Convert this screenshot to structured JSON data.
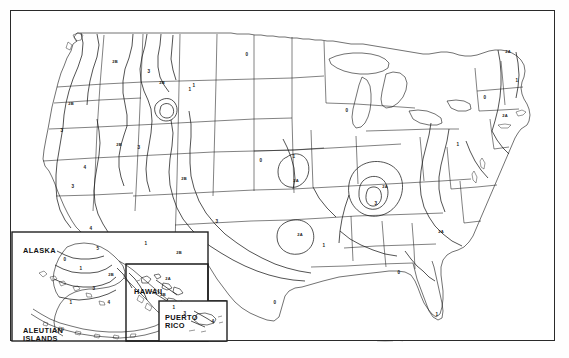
{
  "figure": {
    "background_color": "#ffffff",
    "line_color": "#1a1a1a",
    "frame_color": "#2a2a2a"
  },
  "insets": [
    {
      "id": "alaska",
      "label": "ALASKA"
    },
    {
      "id": "aleutian",
      "label": "ALEUTIAN\nISLANDS"
    },
    {
      "id": "hawaii",
      "label": "HAWAII"
    },
    {
      "id": "puertorico",
      "label": "PUERTO\nRICO"
    }
  ],
  "chart_data": {
    "type": "map",
    "projection": "conic",
    "zone_scheme": [
      "0",
      "1",
      "2A",
      "2B",
      "3",
      "4",
      "5"
    ],
    "zone_labels": [
      {
        "text": "2B",
        "x": 104,
        "y": 51,
        "region": "northern-idaho"
      },
      {
        "text": "3",
        "x": 138,
        "y": 61,
        "region": "western-montana"
      },
      {
        "text": "2B",
        "x": 151,
        "y": 72,
        "region": "montana-divide"
      },
      {
        "text": "1",
        "x": 183,
        "y": 75,
        "region": "central-montana"
      },
      {
        "text": "2B",
        "x": 60,
        "y": 93,
        "region": "oregon"
      },
      {
        "text": "2B",
        "x": 108,
        "y": 134,
        "region": "southern-idaho"
      },
      {
        "text": "3",
        "x": 51,
        "y": 120,
        "region": "northern-california"
      },
      {
        "text": "3",
        "x": 128,
        "y": 137,
        "region": "wyoming-border"
      },
      {
        "text": "1",
        "x": 179,
        "y": 79,
        "region": "eastern-montana"
      },
      {
        "text": "4",
        "x": 74,
        "y": 157,
        "region": "california-sierra"
      },
      {
        "text": "3",
        "x": 62,
        "y": 176,
        "region": "central-california"
      },
      {
        "text": "2B",
        "x": 173,
        "y": 168,
        "region": "colorado-plateau"
      },
      {
        "text": "3",
        "x": 206,
        "y": 211,
        "region": "new-mexico"
      },
      {
        "text": "4",
        "x": 80,
        "y": 218,
        "region": "southern-california"
      },
      {
        "text": "5",
        "x": 87,
        "y": 238,
        "region": "imperial-valley"
      },
      {
        "text": "1",
        "x": 135,
        "y": 233,
        "region": "arizona"
      },
      {
        "text": "2B",
        "x": 168,
        "y": 242,
        "region": "west-texas"
      },
      {
        "text": "0",
        "x": 236,
        "y": 44,
        "region": "north-dakota"
      },
      {
        "text": "0",
        "x": 336,
        "y": 100,
        "region": "wisconsin"
      },
      {
        "text": "0",
        "x": 250,
        "y": 150,
        "region": "nebraska-kansas"
      },
      {
        "text": "1",
        "x": 283,
        "y": 146,
        "region": "kansas-missouri"
      },
      {
        "text": "2A",
        "x": 285,
        "y": 170,
        "region": "oklahoma-contour"
      },
      {
        "text": "2A",
        "x": 289,
        "y": 224,
        "region": "east-texas"
      },
      {
        "text": "1",
        "x": 313,
        "y": 235,
        "region": "louisiana"
      },
      {
        "text": "0",
        "x": 264,
        "y": 292,
        "region": "south-texas"
      },
      {
        "text": "2A",
        "x": 374,
        "y": 176,
        "region": "tennessee-valley"
      },
      {
        "text": "3",
        "x": 365,
        "y": 193,
        "region": "new-madrid"
      },
      {
        "text": "2A",
        "x": 430,
        "y": 221,
        "region": "south-carolina"
      },
      {
        "text": "0",
        "x": 388,
        "y": 262,
        "region": "gulf-coast"
      },
      {
        "text": "1",
        "x": 426,
        "y": 304,
        "region": "florida"
      },
      {
        "text": "2A",
        "x": 497,
        "y": 41,
        "region": "maine"
      },
      {
        "text": "1",
        "x": 506,
        "y": 70,
        "region": "northern-maine"
      },
      {
        "text": "2A",
        "x": 494,
        "y": 105,
        "region": "massachusetts"
      },
      {
        "text": "1",
        "x": 447,
        "y": 134,
        "region": "pennsylvania"
      },
      {
        "text": "0",
        "x": 474,
        "y": 87,
        "region": "new-york"
      },
      {
        "text": "0",
        "x": 54,
        "y": 249,
        "region": "alaska-interior"
      },
      {
        "text": "1",
        "x": 70,
        "y": 258,
        "region": "alaska-south"
      },
      {
        "text": "2B",
        "x": 100,
        "y": 264,
        "region": "alaska-southeast"
      },
      {
        "text": "3",
        "x": 83,
        "y": 278,
        "region": "alaska-peninsula"
      },
      {
        "text": "4",
        "x": 98,
        "y": 292,
        "region": "alaska-coastal"
      },
      {
        "text": "1",
        "x": 60,
        "y": 292,
        "region": "aleutian-west"
      },
      {
        "text": "2A",
        "x": 157,
        "y": 268,
        "region": "hawaii-kauai"
      },
      {
        "text": "2B",
        "x": 152,
        "y": 284,
        "region": "hawaii-oahu"
      },
      {
        "text": "1",
        "x": 163,
        "y": 297,
        "region": "hawaii-big-island"
      },
      {
        "text": "3",
        "x": 174,
        "y": 303,
        "region": "puerto-rico-north"
      },
      {
        "text": "4",
        "x": 202,
        "y": 311,
        "region": "puerto-rico-east"
      }
    ]
  }
}
